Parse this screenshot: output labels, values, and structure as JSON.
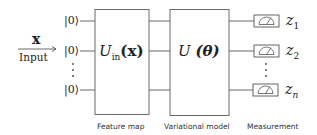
{
  "input": {
    "symbol": "x",
    "label": "Input"
  },
  "qubits": [
    "|0⟩",
    "|0⟩",
    "|0⟩"
  ],
  "feature_map": {
    "gate": "U",
    "subscript": "in",
    "arg": "(x)",
    "caption": "Feature map"
  },
  "variational": {
    "gate": "U",
    "arg": "(θ)",
    "caption": "Variational model"
  },
  "measurement": {
    "caption": "Measurement",
    "outputs": [
      {
        "base": "z",
        "sub": "1"
      },
      {
        "base": "z",
        "sub": "2"
      },
      {
        "base": "z",
        "sub": "n"
      }
    ]
  },
  "colors": {
    "stroke": "#6a6a6a",
    "text": "#222222"
  }
}
